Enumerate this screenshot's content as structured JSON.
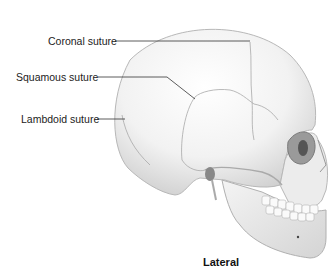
{
  "figure": {
    "view_caption": "Lateral",
    "labels": [
      {
        "id": "coronal",
        "text": "Coronal suture"
      },
      {
        "id": "squamous",
        "text": "Squamous suture"
      },
      {
        "id": "lambdoid",
        "text": "Lambdoid suture"
      }
    ]
  }
}
